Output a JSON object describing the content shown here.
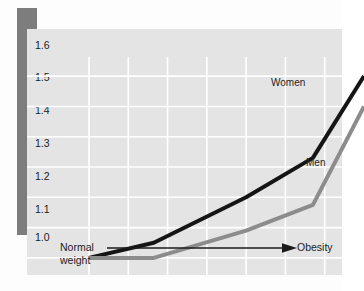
{
  "figure": {
    "title_band_color": "#8a8a8a",
    "accent_bar_color": "#7d7d7d",
    "panel_color": "#e4e4e4",
    "gridline_color": "#ffffff"
  },
  "axis": {
    "y_ticks": [
      "1.6",
      "1.5",
      "1.4",
      "1.3",
      "1.2",
      "1.1",
      "1.0"
    ],
    "x_left_label": "Normal\nweight",
    "x_right_label": "Obesity",
    "x_arrow_icon": "arrow-right-icon"
  },
  "series_labels": {
    "women": "Women",
    "men": "Men"
  },
  "chart_data": {
    "type": "line",
    "xlabel": "Body weight (Normal weight → Obesity)",
    "ylabel": "Relative risk of death from cancer",
    "ylim": [
      0.97,
      1.65
    ],
    "xlim": [
      0,
      7
    ],
    "ytick_values": [
      1.0,
      1.1,
      1.2,
      1.3,
      1.4,
      1.5,
      1.6
    ],
    "ytick_labels": [
      "1.0",
      "1.1",
      "1.2",
      "1.3",
      "1.4",
      "1.5",
      "1.6"
    ],
    "xtick_labels": [],
    "grid": true,
    "grid_color": "#ffffff",
    "legend": "inline-labels",
    "legend_position": "right-of-curves",
    "annotations": [
      {
        "text": "Women",
        "x": 5.4,
        "y": 1.545
      },
      {
        "text": "Men",
        "x": 6.45,
        "y": 1.295
      },
      {
        "text": "Normal weight",
        "x": 0.3,
        "y": 0.96
      },
      {
        "text": "Obesity",
        "x": 6.9,
        "y": 0.96
      }
    ],
    "series": [
      {
        "name": "Women",
        "color": "#151515",
        "line_width": 4,
        "x": [
          0.0,
          1.65,
          4.0,
          5.7,
          7.0
        ],
        "values": [
          1.0,
          1.05,
          1.2,
          1.33,
          1.6
        ]
      },
      {
        "name": "Men",
        "color": "#8c8c8c",
        "line_width": 4,
        "x": [
          0.0,
          1.65,
          4.0,
          5.7,
          7.0
        ],
        "values": [
          1.0,
          1.0,
          1.09,
          1.175,
          1.5
        ]
      }
    ]
  }
}
